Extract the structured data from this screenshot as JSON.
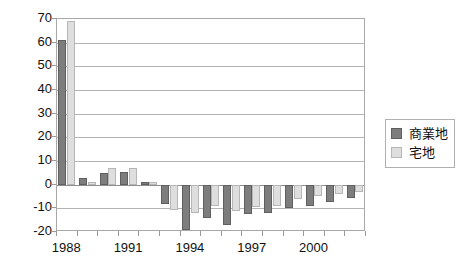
{
  "chart_data": {
    "type": "bar",
    "title": "",
    "subtitle": "",
    "xlabel": "",
    "ylabel": "",
    "ylim": [
      -20,
      70
    ],
    "yticks": [
      70,
      60,
      50,
      40,
      30,
      20,
      10,
      0,
      -10,
      -20
    ],
    "ytick_labels": [
      "70",
      "60",
      "50",
      "40",
      "30",
      "20",
      "10",
      "0",
      "-10",
      "-20"
    ],
    "grid": true,
    "grid_axis": "y",
    "legend_position": "right",
    "categories": [
      "1988",
      "1989",
      "1990",
      "1991",
      "1992",
      "1993",
      "1994",
      "1995",
      "1996",
      "1997",
      "1998",
      "1999",
      "2000",
      "2001",
      "2002"
    ],
    "xtick_labels_shown": [
      "1988",
      "1991",
      "1994",
      "1997",
      "2000"
    ],
    "xtick_label_interval": 3,
    "series": [
      {
        "name": "商業地",
        "color": "#7d7d7d",
        "values": [
          61,
          3,
          5,
          5.5,
          1,
          -8,
          -19,
          -14,
          -17,
          -12.5,
          -12,
          -10,
          -9,
          -7.5,
          -5.5
        ]
      },
      {
        "name": "宅地",
        "color": "#dedede",
        "values": [
          69,
          1,
          7,
          7,
          1,
          -10.5,
          -12,
          -9,
          -11,
          -9.5,
          -9,
          -6,
          -5,
          -4,
          -3
        ]
      }
    ]
  },
  "legend": {
    "items": [
      {
        "label": "商業地",
        "swatch": "commercial-swatch"
      },
      {
        "label": "宅地",
        "swatch": "residential-swatch"
      }
    ]
  }
}
